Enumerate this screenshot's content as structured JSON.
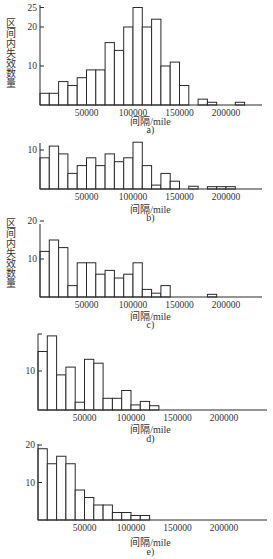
{
  "figure": {
    "ylabel": "区间内失效数量",
    "xlabel": "间隔/mile"
  },
  "chart_data": [
    {
      "type": "bar",
      "panel": "a)",
      "xlabel": "间隔/mile",
      "ylabel": "区间内失效数量",
      "bin_width": 10000,
      "bin_starts": [
        0,
        10000,
        20000,
        30000,
        40000,
        50000,
        60000,
        70000,
        80000,
        90000,
        100000,
        110000,
        120000,
        130000,
        140000,
        150000,
        160000,
        170000,
        180000,
        190000,
        200000,
        210000
      ],
      "values": [
        3,
        3,
        6,
        5,
        7,
        9,
        9,
        16,
        14,
        20,
        25,
        20,
        22,
        10,
        11,
        5,
        0,
        1.5,
        0.7,
        0,
        0,
        0.7
      ],
      "xticks": [
        50000,
        100000,
        150000,
        200000
      ],
      "yticks": [
        10,
        20,
        25
      ],
      "ylim": [
        0,
        25
      ],
      "xlim": [
        0,
        225000
      ]
    },
    {
      "type": "bar",
      "panel": "b)",
      "xlabel": "间隔/mile",
      "ylabel": "",
      "bin_width": 10000,
      "bin_starts": [
        0,
        10000,
        20000,
        30000,
        40000,
        50000,
        60000,
        70000,
        80000,
        90000,
        100000,
        110000,
        120000,
        130000,
        140000,
        150000,
        160000,
        170000,
        180000,
        190000,
        200000,
        210000
      ],
      "values": [
        8,
        11,
        9,
        4,
        6,
        8,
        6,
        9,
        7,
        8,
        12,
        6,
        1,
        4,
        2,
        0,
        0.7,
        0,
        0.6,
        0.6,
        0.6,
        0
      ],
      "xticks": [
        50000,
        100000,
        150000,
        200000
      ],
      "yticks": [
        10
      ],
      "ylim": [
        0,
        12
      ],
      "xlim": [
        0,
        225000
      ]
    },
    {
      "type": "bar",
      "panel": "c)",
      "xlabel": "间隔/mile",
      "ylabel": "区间内失效数量",
      "bin_width": 10000,
      "bin_starts": [
        0,
        10000,
        20000,
        30000,
        40000,
        50000,
        60000,
        70000,
        80000,
        90000,
        100000,
        110000,
        120000,
        130000,
        140000,
        150000,
        160000,
        170000,
        180000,
        190000,
        200000,
        210000
      ],
      "values": [
        12,
        15,
        13,
        3,
        9,
        9,
        6,
        7,
        5,
        6,
        9,
        2,
        1,
        3,
        0,
        0,
        0,
        0,
        0.7,
        0,
        0,
        0
      ],
      "xticks": [
        50000,
        100000,
        150000,
        200000
      ],
      "yticks": [
        10,
        20
      ],
      "ylim": [
        0,
        20
      ],
      "xlim": [
        0,
        225000
      ]
    },
    {
      "type": "bar",
      "panel": "d)",
      "xlabel": "间隔/mile",
      "ylabel": "",
      "bin_width": 10000,
      "bin_starts": [
        0,
        10000,
        20000,
        30000,
        40000,
        50000,
        60000,
        70000,
        80000,
        90000,
        100000,
        110000,
        120000
      ],
      "values": [
        15,
        19,
        9,
        11,
        2,
        13,
        12,
        3,
        3,
        5,
        1.3,
        2.2,
        1.1
      ],
      "xticks": [
        50000,
        100000,
        150000,
        200000
      ],
      "yticks": [
        10
      ],
      "ylim": [
        0,
        20
      ],
      "xlim": [
        0,
        225000
      ]
    },
    {
      "type": "bar",
      "panel": "e)",
      "xlabel": "间隔/mile",
      "ylabel": "",
      "bin_width": 10000,
      "bin_starts": [
        0,
        10000,
        20000,
        30000,
        40000,
        50000,
        60000,
        70000,
        80000,
        90000,
        100000,
        110000
      ],
      "values": [
        19,
        15,
        17,
        15,
        8,
        6,
        4,
        4,
        2,
        2,
        1.2,
        1.2
      ],
      "xticks": [
        50000,
        100000,
        150000,
        200000
      ],
      "yticks": [
        10,
        20
      ],
      "ylim": [
        0,
        20
      ],
      "xlim": [
        0,
        225000
      ]
    }
  ],
  "panels": [
    {
      "caption": "a)",
      "xlabel": "间隔/mile",
      "ylabel": "区间内失效数量",
      "xtick_labels": [
        "50000",
        "100000",
        "150000",
        "200000"
      ],
      "ytick_labels": [
        "10",
        "20",
        "25"
      ]
    },
    {
      "caption": "b)",
      "xlabel": "间隔/mile",
      "ylabel": "",
      "xtick_labels": [
        "50000",
        "100000",
        "150000",
        "200000"
      ],
      "ytick_labels": [
        "10"
      ]
    },
    {
      "caption": "c)",
      "xlabel": "间隔/mile",
      "ylabel": "区间内失效数量",
      "xtick_labels": [
        "50000",
        "100000",
        "150000",
        "200000"
      ],
      "ytick_labels": [
        "10",
        "20"
      ]
    },
    {
      "caption": "d)",
      "xlabel": "间隔/mile",
      "ylabel": "",
      "xtick_labels": [
        "50000",
        "100000",
        "150000",
        "200000"
      ],
      "ytick_labels": [
        "10"
      ]
    },
    {
      "caption": "e)",
      "xlabel": "间隔/mile",
      "ylabel": "",
      "xtick_labels": [
        "50000",
        "100000",
        "150000",
        "200000"
      ],
      "ytick_labels": [
        "10",
        "20"
      ]
    }
  ],
  "style": {
    "bar_stroke": "#2a2a2a",
    "bar_fill": "#ffffff",
    "axis_color": "#2a2a2a"
  }
}
